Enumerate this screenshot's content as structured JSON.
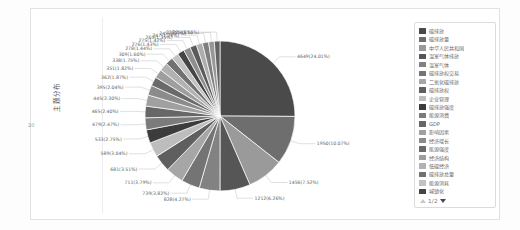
{
  "panel": {
    "vertical_axis_label": "主题分布",
    "vertical_axis_sub": "20"
  },
  "legend": {
    "items": [
      {
        "label": "碳排放",
        "color": "#4a4a4a"
      },
      {
        "label": "碳排放量",
        "color": "#6e6e6e"
      },
      {
        "label": "中华人民共和国",
        "color": "#9a9a9a"
      },
      {
        "label": "温室气体排放",
        "color": "#565656"
      },
      {
        "label": "温室气体",
        "color": "#828282"
      },
      {
        "label": "碳排放权交易",
        "color": "#747474"
      },
      {
        "label": "二氧化碳排放",
        "color": "#a6a6a6"
      },
      {
        "label": "碳排放权",
        "color": "#5f5f5f"
      },
      {
        "label": "企业管理",
        "color": "#bdbdbd"
      },
      {
        "label": "碳排放强度",
        "color": "#3c3c3c"
      },
      {
        "label": "能源消费",
        "color": "#7b7b7b"
      },
      {
        "label": "GDP",
        "color": "#676767"
      },
      {
        "label": "影响因素",
        "color": "#a0a0a0"
      },
      {
        "label": "经济增长",
        "color": "#8b8b8b"
      },
      {
        "label": "能源强度",
        "color": "#6a6a6a"
      },
      {
        "label": "经济结构",
        "color": "#9e9e9e"
      },
      {
        "label": "低碳经济",
        "color": "#b2b2b2"
      },
      {
        "label": "碳排放总量",
        "color": "#717171"
      },
      {
        "label": "能源消耗",
        "color": "#c2c2c2"
      },
      {
        "label": "城镇化",
        "color": "#454545"
      }
    ],
    "pager": {
      "text": "1/2",
      "up_icon": "triangle-up-icon",
      "down_icon": "triangle-down-icon"
    }
  },
  "chart_data": {
    "type": "pie",
    "title": "",
    "legend_position": "right",
    "label_format": "value(percent%)",
    "categories": [
      "碳排放",
      "碳排放量",
      "中华人民共和国",
      "温室气体排放",
      "温室气体",
      "碳排放权交易",
      "二氧化碳排放",
      "碳排放权",
      "企业管理",
      "碳排放强度",
      "能源消费",
      "GDP",
      "影响因素",
      "经济增长",
      "能源强度",
      "经济结构",
      "低碳经济",
      "碳排放总量",
      "能源消耗",
      "城镇化",
      "项目21",
      "项目22",
      "项目23",
      "项目24",
      "项目25",
      "项目26"
    ],
    "values": [
      4649,
      1950,
      1456,
      1212,
      828,
      739,
      711,
      681,
      589,
      533,
      479,
      465,
      445,
      395,
      362,
      351,
      338,
      309,
      278,
      276,
      275,
      265,
      247,
      245,
      228,
      225
    ],
    "percents": [
      24.01,
      10.07,
      7.52,
      6.26,
      4.27,
      3.82,
      3.79,
      3.51,
      3.04,
      2.75,
      2.47,
      2.4,
      2.3,
      2.04,
      1.87,
      1.82,
      1.75,
      1.6,
      1.44,
      1.43,
      1.42,
      1.35,
      1.28,
      1.27,
      1.18,
      1.16
    ],
    "labels": [
      "4649(24.01%)",
      "1950(10.07%)",
      "1456(7.52%)",
      "1212(6.26%)",
      "828(4.27%)",
      "739(3.82%)",
      "711(3.79%)",
      "681(3.51%)",
      "589(3.04%)",
      "533(2.75%)",
      "479(2.47%)",
      "465(2.40%)",
      "445(2.30%)",
      "395(2.04%)",
      "362(1.87%)",
      "351(1.82%)",
      "338(1.75%)",
      "309(1.60%)",
      "278(1.44%)",
      "276(1.43%)",
      "275(1.42%)",
      "265(1.35%)",
      "247(1.28%)",
      "245(1.27%)",
      "228(1.18%)",
      "225(1.16%)"
    ],
    "colors": [
      "#4a4a4a",
      "#6e6e6e",
      "#9a9a9a",
      "#565656",
      "#828282",
      "#747474",
      "#a6a6a6",
      "#5f5f5f",
      "#bdbdbd",
      "#3c3c3c",
      "#7b7b7b",
      "#676767",
      "#a0a0a0",
      "#8b8b8b",
      "#6a6a6a",
      "#9e9e9e",
      "#b2b2b2",
      "#717171",
      "#c2c2c2",
      "#454545",
      "#8f8f8f",
      "#5b5b5b",
      "#adadad",
      "#7f7f7f",
      "#989898",
      "#636363"
    ],
    "total": 19364
  }
}
